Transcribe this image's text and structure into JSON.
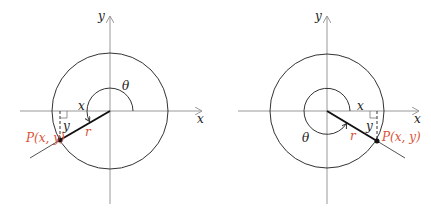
{
  "diagrams": [
    {
      "id": "left",
      "labels": {
        "y_axis": "y",
        "x_axis": "x",
        "theta": "θ",
        "x_leg": "x",
        "y_leg": "y",
        "r": "r",
        "point": "P(x, y)"
      }
    },
    {
      "id": "right",
      "labels": {
        "y_axis": "y",
        "x_axis": "x",
        "theta": "θ",
        "x_leg": "x",
        "y_leg": "y",
        "r": "r",
        "point": "P(x, y)"
      }
    }
  ],
  "colors": {
    "axis": "#999999",
    "circle": "#333333",
    "radius": "#111111",
    "accent": "#d9533a"
  }
}
